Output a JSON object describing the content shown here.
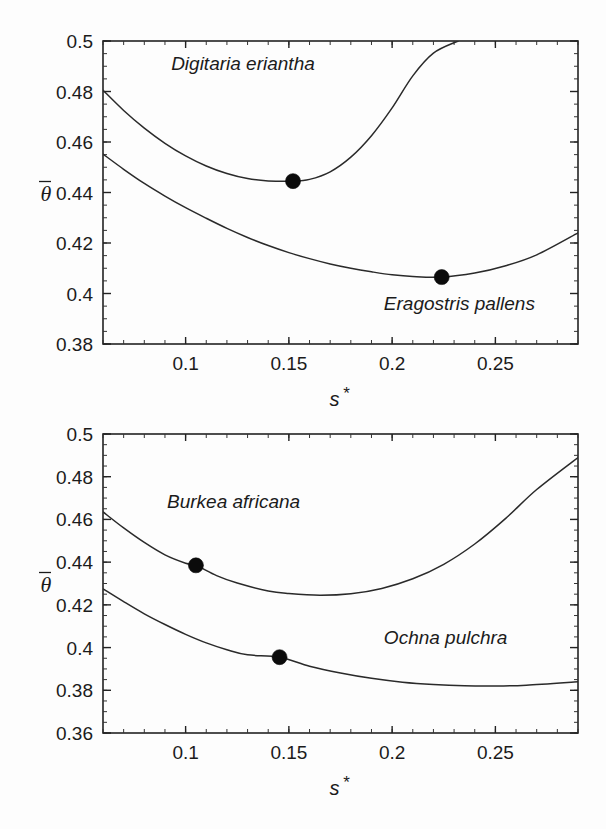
{
  "figure": {
    "background": "#fdfdfd",
    "ink_color": "#222222",
    "panel_count": 2
  },
  "chart_data": [
    {
      "id": "panel-top",
      "type": "line",
      "title": "",
      "xlabel": "s*",
      "ylabel": "θ̄",
      "xlim": [
        0.06,
        0.29
      ],
      "ylim": [
        0.38,
        0.5
      ],
      "grid": false,
      "legend_position": "inline-annotation",
      "x_ticks": [
        0.1,
        0.15,
        0.2,
        0.25
      ],
      "x_tick_labels": [
        "0.1",
        "0.15",
        "0.2",
        "0.25"
      ],
      "x_minor_step": 0.01,
      "y_ticks": [
        0.38,
        0.4,
        0.42,
        0.44,
        0.46,
        0.48,
        0.5
      ],
      "y_tick_labels": [
        "0.38",
        "0.4",
        "0.42",
        "0.44",
        "0.46",
        "0.48",
        "0.5"
      ],
      "y_minor_step": 0.005,
      "series": [
        {
          "name": "Digitaria eriantha",
          "label": "Digitaria eriantha",
          "label_x": 0.093,
          "label_y": 0.4885,
          "marker": {
            "x": 0.152,
            "y": 0.4445
          },
          "x": [
            0.06,
            0.07,
            0.08,
            0.09,
            0.1,
            0.11,
            0.12,
            0.13,
            0.14,
            0.152,
            0.16,
            0.17,
            0.18,
            0.19,
            0.2,
            0.21,
            0.22,
            0.232
          ],
          "y": [
            0.4805,
            0.4725,
            0.4655,
            0.4595,
            0.4545,
            0.4505,
            0.4475,
            0.4455,
            0.4446,
            0.4445,
            0.4452,
            0.4482,
            0.454,
            0.4625,
            0.4735,
            0.4862,
            0.4952,
            0.5
          ]
        },
        {
          "name": "Eragostris pallens",
          "label": "Eragostris pallens",
          "label_x": 0.196,
          "label_y": 0.3935,
          "marker": {
            "x": 0.224,
            "y": 0.4065
          },
          "x": [
            0.06,
            0.07,
            0.08,
            0.09,
            0.1,
            0.11,
            0.12,
            0.13,
            0.14,
            0.15,
            0.16,
            0.17,
            0.18,
            0.19,
            0.2,
            0.21,
            0.224,
            0.24,
            0.255,
            0.27,
            0.29
          ],
          "y": [
            0.4552,
            0.4492,
            0.4436,
            0.4386,
            0.434,
            0.4298,
            0.4258,
            0.4222,
            0.419,
            0.4162,
            0.4138,
            0.4117,
            0.41,
            0.4086,
            0.4074,
            0.4067,
            0.4065,
            0.4081,
            0.411,
            0.4153,
            0.424
          ]
        }
      ]
    },
    {
      "id": "panel-bottom",
      "type": "line",
      "title": "",
      "xlabel": "s*",
      "ylabel": "θ̄",
      "xlim": [
        0.06,
        0.29
      ],
      "ylim": [
        0.36,
        0.5
      ],
      "grid": false,
      "legend_position": "inline-annotation",
      "x_ticks": [
        0.1,
        0.15,
        0.2,
        0.25
      ],
      "x_tick_labels": [
        "0.1",
        "0.15",
        "0.2",
        "0.25"
      ],
      "x_minor_step": 0.01,
      "y_ticks": [
        0.36,
        0.38,
        0.4,
        0.42,
        0.44,
        0.46,
        0.48,
        0.5
      ],
      "y_tick_labels": [
        "0.36",
        "0.38",
        "0.4",
        "0.42",
        "0.44",
        "0.46",
        "0.48",
        "0.5"
      ],
      "y_minor_step": 0.005,
      "series": [
        {
          "name": "Burkea africana",
          "label": "Burkea africana",
          "label_x": 0.091,
          "label_y": 0.4655,
          "marker": {
            "x": 0.105,
            "y": 0.4385
          },
          "x": [
            0.06,
            0.07,
            0.08,
            0.09,
            0.1,
            0.105,
            0.115,
            0.125,
            0.14,
            0.15,
            0.165,
            0.18,
            0.195,
            0.21,
            0.225,
            0.24,
            0.255,
            0.27,
            0.29
          ],
          "y": [
            0.4635,
            0.456,
            0.4492,
            0.4434,
            0.4395,
            0.4385,
            0.4337,
            0.4302,
            0.4265,
            0.4253,
            0.4245,
            0.4252,
            0.4277,
            0.4322,
            0.439,
            0.4485,
            0.4605,
            0.474,
            0.489
          ]
        },
        {
          "name": "Ochna pulchra",
          "label": "Ochna pulchra",
          "label_x": 0.196,
          "label_y": 0.4015,
          "marker": {
            "x": 0.1455,
            "y": 0.3955
          },
          "x": [
            0.06,
            0.07,
            0.08,
            0.09,
            0.1,
            0.11,
            0.12,
            0.13,
            0.1455,
            0.16,
            0.175,
            0.19,
            0.205,
            0.22,
            0.235,
            0.25,
            0.265,
            0.29
          ],
          "y": [
            0.4275,
            0.4215,
            0.4158,
            0.4108,
            0.4062,
            0.4022,
            0.399,
            0.3966,
            0.3955,
            0.3913,
            0.3881,
            0.3856,
            0.3838,
            0.3827,
            0.3821,
            0.382,
            0.3824,
            0.384
          ]
        }
      ]
    }
  ]
}
